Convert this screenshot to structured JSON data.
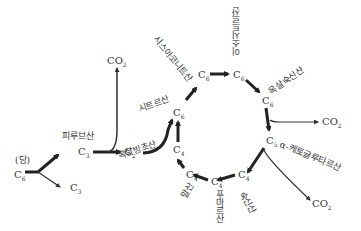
{
  "diagram": {
    "title": "",
    "start": {
      "label": "(당)",
      "node": "C6"
    },
    "nodes": {
      "sugar": "C",
      "pyruvate": "C",
      "c3_lower": "C",
      "acetyl": "C",
      "citrate": "C",
      "cis_aconitate": "C",
      "isocitrate": "C",
      "oxalosuccinate": "C",
      "akg": "C",
      "succinate": "C",
      "fumarate": "C",
      "malate": "C",
      "oxaloacetate": "C"
    },
    "subscripts": {
      "sugar": "6",
      "pyruvate": "3",
      "c3_lower": "3",
      "acetyl": "2",
      "citrate": "6",
      "cis_aconitate": "6",
      "isocitrate": "6",
      "oxalosuccinate": "6",
      "akg": "5",
      "succinate": "4",
      "fumarate": "4",
      "malate": "4",
      "oxaloacetate": "4"
    },
    "labels": {
      "sugar": "(당)",
      "pyruvate": "피루브산",
      "citrate": "시트르산",
      "cis_aconitate": "시스아코니트산",
      "isocitrate": "이소시트르산",
      "oxalosuccinate": "옥살숙신산",
      "akg": "α-케토글루타르산",
      "succinate": "숙신산",
      "fumarate": "푸마르산",
      "malate": "말산",
      "oxaloacetate": "옥살빙초산"
    },
    "co2": {
      "label": "CO",
      "sub": "2"
    }
  }
}
